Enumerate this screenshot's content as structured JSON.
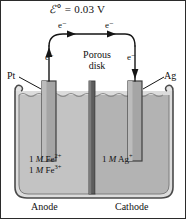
{
  "figure": {
    "background_color": "#ffffff",
    "border_color": "#2b2b2b"
  },
  "cell_potential": {
    "symbol": "ℰ°",
    "equals": "=",
    "value": "0.03",
    "unit": "V",
    "full_text": "ℰ° = 0.03 V"
  },
  "electron_labels": {
    "wire_left": "e⁻",
    "wire_right": "e⁻",
    "lead_left": "e⁻",
    "lead_right": "e⁻"
  },
  "separator": {
    "label_line1": "Porous",
    "label_line2": "disk",
    "color": "#595959"
  },
  "electrodes": [
    {
      "name": "platinum-electrode",
      "label": "Pt",
      "side": "left",
      "color": "#9a9a9a"
    },
    {
      "name": "silver-electrode",
      "label": "Ag",
      "side": "right",
      "color": "#9a9a9a"
    }
  ],
  "solutions": [
    {
      "name": "anode-solution",
      "side": "left",
      "line1_conc": "1",
      "line1_unit": "M",
      "line1_species": "Fe",
      "line1_charge": "2+",
      "line2_conc": "1",
      "line2_unit": "M",
      "line2_species": "Fe",
      "line2_charge": "3+",
      "fill_color": "#c3c3c3"
    },
    {
      "name": "cathode-solution",
      "side": "right",
      "line1_conc": "1",
      "line1_unit": "M",
      "line1_species": "Ag",
      "line1_charge": "+",
      "fill_color": "#b3b3b3"
    }
  ],
  "half_cells": {
    "left_label": "Anode",
    "right_label": "Cathode"
  },
  "beaker": {
    "glass_color": "#d8d8d8",
    "outline_color": "#4a4a4a"
  }
}
